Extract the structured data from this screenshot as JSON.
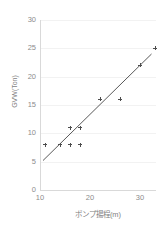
{
  "chart_data": {
    "type": "scatter",
    "title": "",
    "xlabel": "ポンプ揚程(m)",
    "ylabel": "GVW(Ton)",
    "xlim": [
      10,
      33.2
    ],
    "ylim": [
      0,
      30
    ],
    "xticks": [
      10,
      20,
      30
    ],
    "yticks": [
      0,
      5,
      10,
      15,
      20,
      25,
      30
    ],
    "xtick_labels": [
      "10",
      "20",
      "30"
    ],
    "ytick_labels": [
      "0",
      "5",
      "10",
      "15",
      "20",
      "25",
      "30"
    ],
    "grid": "horizontal",
    "legend": "none",
    "series": [
      {
        "name": "GVW(Ton)",
        "marker": "plus",
        "color": "#4d4d4d",
        "points": [
          {
            "x": 11,
            "y": 8
          },
          {
            "x": 14,
            "y": 8
          },
          {
            "x": 16,
            "y": 8
          },
          {
            "x": 18,
            "y": 8
          },
          {
            "x": 16,
            "y": 11
          },
          {
            "x": 18,
            "y": 11
          },
          {
            "x": 22,
            "y": 16
          },
          {
            "x": 26,
            "y": 16
          },
          {
            "x": 30,
            "y": 22
          },
          {
            "x": 33,
            "y": 25
          }
        ]
      }
    ],
    "trendline": {
      "type": "linear",
      "color": "#595959",
      "x_start": 10.6,
      "y_start": 5.2,
      "x_end": 32.3,
      "y_end": 24.0
    }
  },
  "axis": {
    "y_title": "GVW(Ton)",
    "x_title": "ポンプ揚程(m)"
  },
  "colors": {
    "axis": "#d9d9d9",
    "grid": "#f2f2f2",
    "text": "#7f7f7f",
    "marker": "#4d4d4d",
    "trend": "#595959",
    "background": "#ffffff"
  }
}
